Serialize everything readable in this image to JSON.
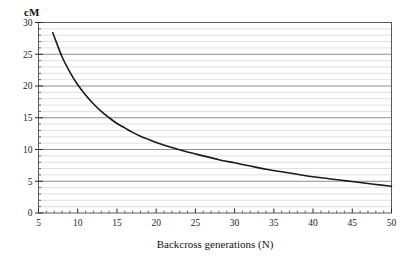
{
  "chart_data": {
    "type": "line",
    "title": "",
    "xlabel": "Backcross generations (N)",
    "ylabel": "cM",
    "xlim": [
      5,
      50
    ],
    "ylim": [
      0,
      30
    ],
    "xticks": [
      5,
      10,
      15,
      20,
      25,
      30,
      35,
      40,
      45,
      50
    ],
    "xtick_labels": [
      "5",
      "10",
      "15",
      "20",
      "25",
      "30",
      "35",
      "40",
      "45",
      "50"
    ],
    "yticks": [
      0,
      5,
      10,
      15,
      20,
      25,
      30
    ],
    "ytick_labels": [
      "0",
      "5",
      "10",
      "15",
      "20",
      "25",
      "30"
    ],
    "minor_xtick_interval": 1,
    "minor_ytick_interval": 1,
    "grid": {
      "horizontal_major": true,
      "horizontal_minor": true,
      "vertical": false,
      "major_color": "#808080",
      "minor_color": "#d8d8d8"
    },
    "legend": null,
    "frame_color": "#555555",
    "line_color": "#1a1a1a",
    "line_width": 1.6,
    "series": [
      {
        "name": "cM vs backcross generations",
        "x": [
          6.8,
          7,
          8,
          9,
          10,
          11,
          12,
          13,
          14,
          15,
          16,
          17,
          18,
          19,
          20,
          22,
          24,
          26,
          28,
          30,
          32,
          34,
          36,
          38,
          40,
          42,
          44,
          46,
          48,
          50
        ],
        "y": [
          28.4,
          27.8,
          24.6,
          22.2,
          20.2,
          18.6,
          17.2,
          16.0,
          15.0,
          14.1,
          13.4,
          12.7,
          12.1,
          11.6,
          11.1,
          10.3,
          9.6,
          9.0,
          8.4,
          7.9,
          7.4,
          6.9,
          6.5,
          6.1,
          5.7,
          5.4,
          5.1,
          4.8,
          4.5,
          4.2
        ]
      }
    ]
  },
  "axes": {
    "y_axis_unit_label": "cM",
    "x_axis_title": "Backcross generations (N)"
  }
}
